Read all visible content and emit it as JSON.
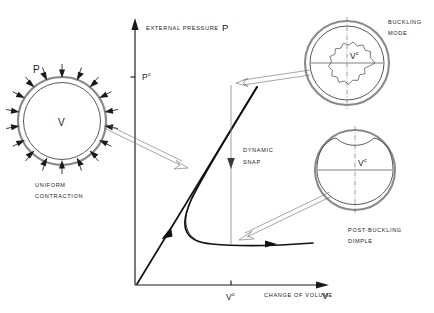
{
  "figure": {
    "type": "engineering-diagram",
    "background_color": "#ffffff",
    "ink_color": "#1a1a1a"
  },
  "axes": {
    "y_axis": {
      "label": "EXTERNAL PRESSURE",
      "symbol": "P",
      "tick_label_base": "P",
      "tick_label_sup": "c"
    },
    "x_axis": {
      "label": "CHANGE OF VOLUME",
      "symbol": "V",
      "tick_label_base": "V",
      "tick_label_sup": "c"
    }
  },
  "annotations": {
    "dynamic_snap_line1": "DYNAMIC",
    "dynamic_snap_line2": "SNAP"
  },
  "insets": [
    {
      "id": "uniform-contraction",
      "caption_line1": "UNIFORM",
      "caption_line2": "CONTRACTION",
      "pressure_symbol": "P",
      "volume_symbol": "V",
      "volume_sup": "",
      "arrow_count": 18
    },
    {
      "id": "buckling-mode",
      "caption_line1": "BUCKLING",
      "caption_line2": "MODE",
      "volume_symbol": "V",
      "volume_sup": "c",
      "lobes": 10
    },
    {
      "id": "post-buckling-dimple",
      "caption_line1": "POST-BUCKLING",
      "caption_line2": "DIMPLE",
      "volume_symbol": "V",
      "volume_sup": "c"
    }
  ],
  "page": {
    "number": ""
  }
}
